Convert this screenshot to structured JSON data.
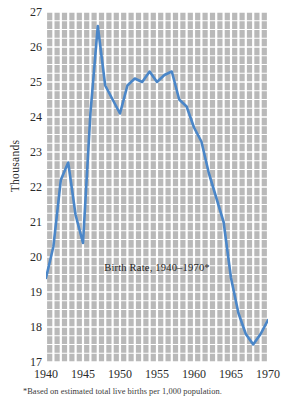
{
  "figure": {
    "ylabel": "Thousands",
    "footnote": "*Based on estimated total live births per 1,000 population.",
    "line_color": "#4a86c8",
    "plot_bg_color": "#b9b9b9",
    "grid_color": "#ffffff"
  },
  "chart_data": {
    "type": "line",
    "title": "Birth Rate, 1940–1970*",
    "xlabel": "",
    "ylabel": "Thousands",
    "xlim": [
      1940,
      1970
    ],
    "ylim": [
      17,
      27
    ],
    "grid": true,
    "legend": "none",
    "xticks": [
      1940,
      1945,
      1950,
      1955,
      1960,
      1965,
      1970
    ],
    "yticks": [
      17,
      18,
      19,
      20,
      21,
      22,
      23,
      24,
      25,
      26,
      27
    ],
    "x": [
      1940,
      1941,
      1942,
      1943,
      1944,
      1945,
      1946,
      1947,
      1948,
      1949,
      1950,
      1951,
      1952,
      1953,
      1954,
      1955,
      1956,
      1957,
      1958,
      1959,
      1960,
      1961,
      1962,
      1963,
      1964,
      1965,
      1966,
      1967,
      1968,
      1969,
      1970
    ],
    "series": [
      {
        "name": "Birth Rate",
        "values": [
          19.4,
          20.3,
          22.2,
          22.7,
          21.2,
          20.4,
          24.1,
          26.6,
          24.9,
          24.5,
          24.1,
          24.9,
          25.1,
          25.0,
          25.3,
          25.0,
          25.2,
          25.3,
          24.5,
          24.3,
          23.7,
          23.3,
          22.4,
          21.7,
          21.0,
          19.4,
          18.4,
          17.8,
          17.5,
          17.8,
          18.2
        ]
      }
    ],
    "annotations": [
      {
        "text": "Birth Rate, 1940–1970*",
        "x": 1953,
        "y": 19.7
      }
    ]
  }
}
